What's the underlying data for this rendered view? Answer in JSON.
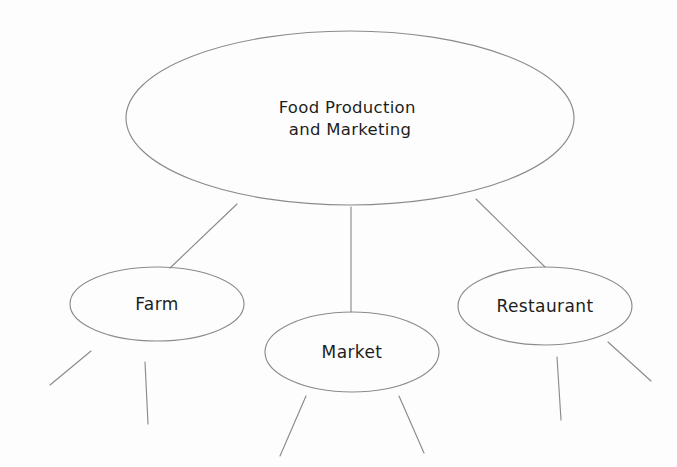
{
  "diagram": {
    "kind": "concept-map",
    "title_text": "Food Production and Marketing",
    "background_color": "#fdfdfd",
    "stroke_color": "#8b8b8b",
    "text_color": "#1d1d1d",
    "root": {
      "id": "root",
      "label_line1": "Food Production",
      "label_line2": "and Marketing",
      "cx": 350,
      "cy": 118,
      "rx": 224,
      "ry": 87
    },
    "children": [
      {
        "id": "farm",
        "label": "Farm",
        "cx": 157,
        "cy": 304,
        "rx": 87,
        "ry": 37
      },
      {
        "id": "market",
        "label": "Market",
        "cx": 352,
        "cy": 352,
        "rx": 87,
        "ry": 40
      },
      {
        "id": "restaurant",
        "label": "Restaurant",
        "cx": 545,
        "cy": 306,
        "rx": 87,
        "ry": 39
      }
    ],
    "links": [
      {
        "id": "root-to-farm",
        "from": "root",
        "to": "farm",
        "x1": 237,
        "y1": 204,
        "x2": 170,
        "y2": 268
      },
      {
        "id": "root-to-market",
        "from": "root",
        "to": "market",
        "x1": 351,
        "y1": 207,
        "x2": 351,
        "y2": 312
      },
      {
        "id": "root-to-restaurant",
        "from": "root",
        "to": "restaurant",
        "x1": 476,
        "y1": 199,
        "x2": 545,
        "y2": 267
      }
    ],
    "stubs": [
      {
        "id": "farm-stub-left",
        "owner": "farm",
        "x1": 91,
        "y1": 351,
        "x2": 50,
        "y2": 385
      },
      {
        "id": "farm-stub-down",
        "owner": "farm",
        "x1": 145,
        "y1": 362,
        "x2": 148,
        "y2": 424
      },
      {
        "id": "market-stub-left",
        "owner": "market",
        "x1": 306,
        "y1": 396,
        "x2": 280,
        "y2": 456
      },
      {
        "id": "market-stub-right",
        "owner": "market",
        "x1": 399,
        "y1": 396,
        "x2": 424,
        "y2": 453
      },
      {
        "id": "restaurant-stub-down",
        "owner": "restaurant",
        "x1": 557,
        "y1": 357,
        "x2": 561,
        "y2": 420
      },
      {
        "id": "restaurant-stub-right",
        "owner": "restaurant",
        "x1": 608,
        "y1": 342,
        "x2": 651,
        "y2": 381
      }
    ]
  }
}
